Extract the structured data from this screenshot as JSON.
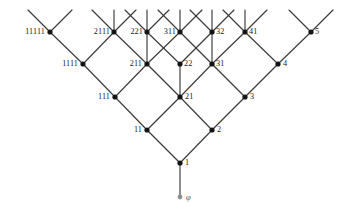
{
  "figure": {
    "type": "hasse-diagram",
    "background": "#ffffff",
    "edge_color": "#3b3b3b",
    "node_color": "#141414",
    "empty_node_color": "#8e8e8e"
  },
  "nodes": [
    {
      "id": "11111",
      "label": "11111",
      "x": 50,
      "y": 32,
      "rank": 5,
      "label_side": "left",
      "label_dx": 5
    },
    {
      "id": "2111",
      "label": "2111",
      "x": 114,
      "y": 32,
      "rank": 5,
      "label_side": "left",
      "label_dx": 4
    },
    {
      "id": "221",
      "label": "221",
      "x": 147,
      "y": 32,
      "rank": 5,
      "label_side": "left",
      "label_dx": 4
    },
    {
      "id": "311",
      "label": "311",
      "x": 180,
      "y": 32,
      "rank": 5,
      "label_side": "left",
      "label_dx": 4
    },
    {
      "id": "32",
      "label": "32",
      "x": 212,
      "y": 32,
      "rank": 5,
      "label_side": "right",
      "label_dx": 4
    },
    {
      "id": "41",
      "label": "41",
      "x": 245,
      "y": 32,
      "rank": 5,
      "label_side": "right",
      "label_dx": 4
    },
    {
      "id": "5",
      "label": "5",
      "x": 311,
      "y": 32,
      "rank": 5,
      "label_side": "right",
      "label_dx": 4
    },
    {
      "id": "1111",
      "label": "1111",
      "x": 83,
      "y": 64,
      "rank": 4,
      "label_side": "left",
      "label_dx": 5
    },
    {
      "id": "211",
      "label": "211",
      "x": 147,
      "y": 64,
      "rank": 4,
      "label_side": "left",
      "label_dx": 5
    },
    {
      "id": "22",
      "label": "22",
      "x": 180,
      "y": 64,
      "rank": 4,
      "label_side": "right",
      "label_dx": 4
    },
    {
      "id": "31",
      "label": "31",
      "x": 212,
      "y": 64,
      "rank": 4,
      "label_side": "right",
      "label_dx": 4
    },
    {
      "id": "4",
      "label": "4",
      "x": 278,
      "y": 64,
      "rank": 4,
      "label_side": "right",
      "label_dx": 5
    },
    {
      "id": "111",
      "label": "111",
      "x": 115,
      "y": 97,
      "rank": 3,
      "label_side": "left",
      "label_dx": 5
    },
    {
      "id": "21",
      "label": "21",
      "x": 180,
      "y": 97,
      "rank": 3,
      "label_side": "right",
      "label_dx": 5
    },
    {
      "id": "3",
      "label": "3",
      "x": 245,
      "y": 97,
      "rank": 3,
      "label_side": "right",
      "label_dx": 5
    },
    {
      "id": "11",
      "label": "11",
      "x": 147,
      "y": 130,
      "rank": 2,
      "label_side": "left",
      "label_dx": 5
    },
    {
      "id": "2",
      "label": "2",
      "x": 212,
      "y": 130,
      "rank": 2,
      "label_side": "right",
      "label_dx": 5
    },
    {
      "id": "1",
      "label": "1",
      "x": 180,
      "y": 163,
      "rank": 1,
      "label_side": "right",
      "label_dx": 5
    },
    {
      "id": "phi",
      "label": "φ",
      "x": 180,
      "y": 197,
      "rank": 0,
      "label_side": "right",
      "label_dx": 6,
      "empty": true
    }
  ],
  "edges": [
    {
      "from": "phi",
      "to": "1"
    },
    {
      "from": "1",
      "to": "11"
    },
    {
      "from": "1",
      "to": "2"
    },
    {
      "from": "11",
      "to": "111"
    },
    {
      "from": "11",
      "to": "21"
    },
    {
      "from": "2",
      "to": "21"
    },
    {
      "from": "2",
      "to": "3"
    },
    {
      "from": "111",
      "to": "1111"
    },
    {
      "from": "111",
      "to": "211"
    },
    {
      "from": "21",
      "to": "211"
    },
    {
      "from": "21",
      "to": "22"
    },
    {
      "from": "21",
      "to": "31"
    },
    {
      "from": "3",
      "to": "31"
    },
    {
      "from": "3",
      "to": "4"
    },
    {
      "from": "1111",
      "to": "11111"
    },
    {
      "from": "1111",
      "to": "2111"
    },
    {
      "from": "211",
      "to": "2111"
    },
    {
      "from": "211",
      "to": "221"
    },
    {
      "from": "211",
      "to": "311"
    },
    {
      "from": "22",
      "to": "221"
    },
    {
      "from": "22",
      "to": "32"
    },
    {
      "from": "31",
      "to": "311"
    },
    {
      "from": "31",
      "to": "32"
    },
    {
      "from": "31",
      "to": "41"
    },
    {
      "from": "4",
      "to": "41"
    },
    {
      "from": "4",
      "to": "5"
    }
  ],
  "stubs": [
    {
      "node": "11111",
      "dir": "up-left"
    },
    {
      "node": "11111",
      "dir": "up-right"
    },
    {
      "node": "2111",
      "dir": "up-left"
    },
    {
      "node": "2111",
      "dir": "up"
    },
    {
      "node": "2111",
      "dir": "up-right"
    },
    {
      "node": "221",
      "dir": "up-left"
    },
    {
      "node": "221",
      "dir": "up"
    },
    {
      "node": "221",
      "dir": "up-right"
    },
    {
      "node": "311",
      "dir": "up-left"
    },
    {
      "node": "311",
      "dir": "up"
    },
    {
      "node": "311",
      "dir": "up-right"
    },
    {
      "node": "32",
      "dir": "up-left"
    },
    {
      "node": "32",
      "dir": "up"
    },
    {
      "node": "32",
      "dir": "up-right"
    },
    {
      "node": "41",
      "dir": "up-left"
    },
    {
      "node": "41",
      "dir": "up"
    },
    {
      "node": "41",
      "dir": "up-right"
    },
    {
      "node": "5",
      "dir": "up-left"
    },
    {
      "node": "5",
      "dir": "up-right"
    }
  ],
  "layout": {
    "stub_length": 22,
    "node_radius": 2.6,
    "empty_node_radius": 2.4,
    "top_cut_y": 10
  }
}
